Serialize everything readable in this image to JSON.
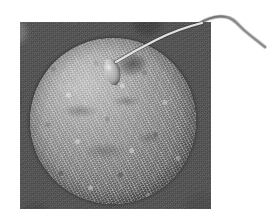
{
  "figure": {
    "kind": "scanning-electron-micrograph",
    "caption": "",
    "canvas": {
      "width": 277,
      "height": 221,
      "background_color": "#ffffff"
    }
  },
  "photo_plate": {
    "name": "micrograph-plate",
    "x": 20,
    "y": 22,
    "width": 191,
    "height": 187,
    "background_color": "#4f4f4f",
    "description": "Rectangular dark-gray SEM photograph plate placed on a white page"
  },
  "specimens": {
    "ovum": {
      "label": "ovum",
      "shape": "sphere",
      "center_x": 113,
      "center_y": 121,
      "diameter": 166,
      "surface": "granular zona pellucida",
      "light_tone": "#cfcfcf",
      "mid_tone": "#9d9d9d",
      "dark_tone": "#4a4a4a"
    },
    "sperm": {
      "label": "sperm",
      "head": {
        "shape": "teardrop",
        "x": 103,
        "y": 58,
        "width": 18,
        "height": 28,
        "rotation_deg": -14,
        "tone": "#c4c4c4"
      },
      "tail": {
        "label": "flagellum",
        "stroke_color_inside_plate": "#e0e0e0",
        "stroke_color_outside_plate": "#8d8d8d",
        "stroke_width": 2.4,
        "description": "Wavy flagellum running up-right from the head, crossing the plate edge and continuing over the white page"
      }
    }
  },
  "colors": {
    "page_background": "#ffffff",
    "plate_background": "#4f4f4f",
    "specimen_highlight": "#dadada",
    "specimen_shadow": "#3a3a3a"
  }
}
